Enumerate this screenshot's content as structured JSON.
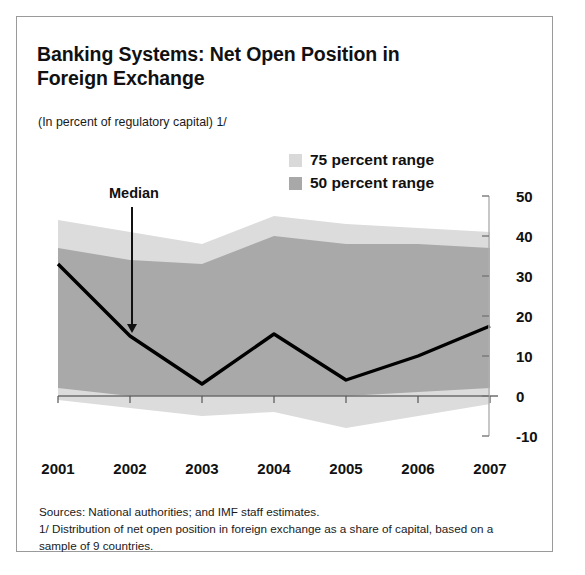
{
  "title": "Banking Systems: Net Open Position in Foreign Exchange",
  "subtitle": "(In percent of regulatory capital) 1/",
  "median_annotation": "Median",
  "legend": [
    {
      "label": "75 percent range",
      "color": "#d4d4d4"
    },
    {
      "label": "50 percent range",
      "color": "#a8a8a8"
    }
  ],
  "notes": {
    "sources": "Sources: National authorities; and IMF staff estimates.",
    "footnote": "1/ Distribution of net open position in foreign exchange as a share of capital, based on a sample of 9 countries."
  },
  "chart_data": {
    "type": "area",
    "title": "Banking Systems: Net Open Position in Foreign Exchange",
    "subtitle": "(In percent of regulatory capital) 1/",
    "xlabel": "",
    "ylabel": "",
    "x": [
      2001,
      2002,
      2003,
      2004,
      2005,
      2006,
      2007
    ],
    "categories": [
      "2001",
      "2002",
      "2003",
      "2004",
      "2005",
      "2006",
      "2007"
    ],
    "ylim": [
      -10,
      50
    ],
    "yticks": [
      -10,
      0,
      10,
      20,
      30,
      40,
      50
    ],
    "ytick_labels": [
      "-10",
      "0",
      "10",
      "20",
      "30",
      "40",
      "50"
    ],
    "grid": false,
    "legend_position": "top-right",
    "zero_line": 0,
    "series": [
      {
        "name": "75 percent range upper",
        "values": [
          44,
          41,
          38,
          45,
          43,
          42,
          41
        ],
        "color": "#d4d4d4"
      },
      {
        "name": "75 percent range lower",
        "values": [
          -1,
          -3,
          -5,
          -4,
          -8,
          -5,
          -2
        ],
        "color": "#d4d4d4"
      },
      {
        "name": "50 percent range upper",
        "values": [
          37,
          34,
          33,
          40,
          38,
          38,
          37
        ],
        "color": "#a8a8a8"
      },
      {
        "name": "50 percent range lower",
        "values": [
          2,
          0,
          0,
          0,
          0,
          1,
          2
        ],
        "color": "#a8a8a8"
      },
      {
        "name": "Median",
        "values": [
          33,
          15,
          3,
          15.5,
          4,
          10,
          17.5
        ],
        "color": "#000000"
      }
    ]
  }
}
